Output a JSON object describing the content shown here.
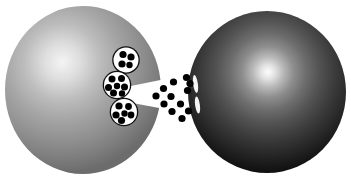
{
  "figure": {
    "type": "diagram",
    "title": "",
    "canvas": {
      "width": 351,
      "height": 181,
      "background": "#ffffff"
    }
  },
  "colors": {
    "background": "#ffffff",
    "presynaptic_highlight": "#f2f2f2",
    "presynaptic_mid": "#9a9a9a",
    "presynaptic_edge": "#6e6e6e",
    "postsynaptic_highlight": "#fbfbfb",
    "postsynaptic_mid": "#4a4a4a",
    "postsynaptic_edge": "#101010",
    "vesicle_fill": "#ffffff",
    "vesicle_outline": "#111111",
    "particle": "#000000",
    "receptor_slit": "#f5f5f5"
  },
  "presynaptic_cell": {
    "label": "presynaptic terminal",
    "center_x": 83,
    "center_y": 90,
    "radius_x": 78,
    "radius_y": 84,
    "highlight_x": 62,
    "highlight_y": 62,
    "notch": {
      "label": "synaptic cleft notch",
      "apex_x": 136,
      "top_y": 80,
      "bottom_y": 108,
      "depth": 14
    }
  },
  "postsynaptic_cell": {
    "label": "postsynaptic cell",
    "center_x": 267,
    "center_y": 92,
    "radius_x": 79,
    "radius_y": 81,
    "highlight_x": 268,
    "highlight_y": 72
  },
  "vesicles": [
    {
      "id": "vesicle-1",
      "label": "docked vesicle upper",
      "cx": 126,
      "cy": 60,
      "r": 12.5,
      "particles": [
        {
          "cx": 123.0,
          "cy": 54.5,
          "r": 3.6
        },
        {
          "cx": 131.0,
          "cy": 57.0,
          "r": 3.6
        },
        {
          "cx": 122.0,
          "cy": 64.0,
          "r": 3.6
        },
        {
          "cx": 129.5,
          "cy": 65.0,
          "r": 3.2
        }
      ]
    },
    {
      "id": "vesicle-2",
      "label": "docked vesicle middle",
      "cx": 117,
      "cy": 85,
      "r": 13.0,
      "particles": [
        {
          "cx": 112.0,
          "cy": 79.0,
          "r": 3.5
        },
        {
          "cx": 121.5,
          "cy": 78.5,
          "r": 3.5
        },
        {
          "cx": 108.5,
          "cy": 87.5,
          "r": 3.5
        },
        {
          "cx": 117.0,
          "cy": 86.0,
          "r": 3.2
        },
        {
          "cx": 124.5,
          "cy": 87.0,
          "r": 3.5
        },
        {
          "cx": 113.5,
          "cy": 93.0,
          "r": 3.5
        },
        {
          "cx": 122.0,
          "cy": 93.5,
          "r": 3.2
        }
      ]
    },
    {
      "id": "vesicle-3",
      "label": "docked vesicle lower",
      "cx": 124,
      "cy": 112,
      "r": 13.0,
      "particles": [
        {
          "cx": 119.0,
          "cy": 106.0,
          "r": 3.6
        },
        {
          "cx": 128.5,
          "cy": 106.5,
          "r": 3.4
        },
        {
          "cx": 116.0,
          "cy": 115.0,
          "r": 3.6
        },
        {
          "cx": 124.5,
          "cy": 113.5,
          "r": 3.2
        },
        {
          "cx": 131.0,
          "cy": 115.0,
          "r": 3.4
        },
        {
          "cx": 121.5,
          "cy": 120.5,
          "r": 3.6
        }
      ]
    }
  ],
  "released_particles": {
    "label": "neurotransmitter molecules in cleft",
    "count": 12,
    "radius": 3.6,
    "points": [
      {
        "cx": 156.0,
        "cy": 96.0
      },
      {
        "cx": 163.5,
        "cy": 88.5
      },
      {
        "cx": 164.0,
        "cy": 104.0
      },
      {
        "cx": 171.0,
        "cy": 96.5
      },
      {
        "cx": 172.0,
        "cy": 111.5
      },
      {
        "cx": 173.5,
        "cy": 82.0
      },
      {
        "cx": 180.5,
        "cy": 104.0
      },
      {
        "cx": 182.0,
        "cy": 118.5
      },
      {
        "cx": 186.5,
        "cy": 77.5
      },
      {
        "cx": 187.5,
        "cy": 90.5
      },
      {
        "cx": 188.5,
        "cy": 111.0
      },
      {
        "cx": 190.0,
        "cy": 83.5
      }
    ]
  },
  "receptor_slits": {
    "label": "receptor channel openings",
    "count": 2,
    "items": [
      {
        "id": "slit-upper",
        "cx": 195.5,
        "cy": 84.0,
        "rx": 2.4,
        "ry": 9.0,
        "rotation": -8
      },
      {
        "id": "slit-lower",
        "cx": 197.5,
        "cy": 105.0,
        "rx": 2.4,
        "ry": 8.5,
        "rotation": -8
      }
    ]
  }
}
